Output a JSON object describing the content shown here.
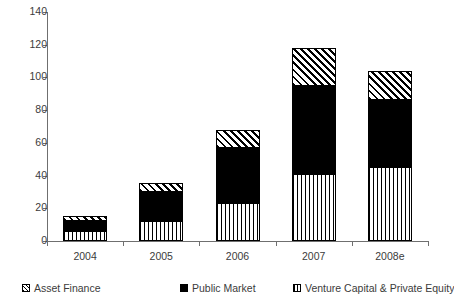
{
  "chart_data": {
    "type": "bar",
    "stacked": true,
    "title": "",
    "subtitle": "",
    "xlabel": "",
    "ylabel": "",
    "categories": [
      "2004",
      "2005",
      "2006",
      "2007",
      "2008e"
    ],
    "ylim": [
      0,
      140
    ],
    "yticks": [
      0,
      20,
      40,
      60,
      80,
      100,
      120,
      140
    ],
    "ytick_labels": [
      "0",
      "20",
      "40",
      "60",
      "80",
      "100",
      "120",
      "140"
    ],
    "grid": false,
    "legend_position": "bottom",
    "series": [
      {
        "name": "Venture Capital & Private Equity",
        "pattern": "vertical-stripes",
        "color": "#000000",
        "values": [
          6,
          12,
          23,
          41,
          45.5
        ]
      },
      {
        "name": "Public Market",
        "pattern": "solid-black",
        "color": "#000000",
        "values": [
          6,
          18,
          34,
          54,
          40.5
        ]
      },
      {
        "name": "Asset Finance",
        "pattern": "diagonal-hatch",
        "color": "#000000",
        "values": [
          3,
          5.5,
          11,
          23,
          18
        ]
      }
    ],
    "totals": [
      15,
      35.5,
      68,
      118,
      104
    ]
  },
  "legend": {
    "items": [
      {
        "label": "Asset Finance",
        "swatch": "diagonal-hatch"
      },
      {
        "label": "Public Market",
        "swatch": "solid-black"
      },
      {
        "label": "Venture Capital & Private Equity",
        "swatch": "vertical-stripes"
      }
    ]
  },
  "axis": {
    "y_max_label": "140",
    "y_min_label": "0"
  }
}
